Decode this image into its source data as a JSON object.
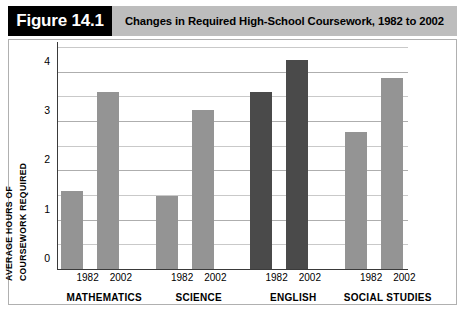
{
  "figure": {
    "badge": "Figure 14.1",
    "title": "Changes in Required High-School Coursework, 1982 to 2002"
  },
  "axis_caption": {
    "line1": "AVERAGE HOURS OF",
    "line2": "COURSEWORK REQUIRED"
  },
  "colors": {
    "bar_light": "#949494",
    "bar_dark": "#4a4a4a",
    "badge_bg": "#000000",
    "title_bg": "#bdbdbd",
    "gridline": "#c9c9c9",
    "axis": "#3a3a3a"
  },
  "chart_data": {
    "type": "bar",
    "title": "Changes in Required High-School Coursework, 1982 to 2002",
    "xlabel": "",
    "ylabel": "AVERAGE HOURS OF COURSEWORK REQUIRED",
    "ylim": [
      0,
      4.5
    ],
    "yticks": [
      0,
      1,
      2,
      3,
      4
    ],
    "ytick_labels": [
      "0",
      "1",
      "2",
      "3",
      "4"
    ],
    "gridlines": [
      0.5,
      1.0,
      1.5,
      2.0,
      2.5,
      3.0,
      3.5,
      4.0,
      4.5
    ],
    "grid": true,
    "legend": "none",
    "categories": [
      "MATHEMATICS",
      "SCIENCE",
      "ENGLISH",
      "SOCIAL STUDIES"
    ],
    "series": [
      {
        "name": "1982",
        "values": [
          1.6,
          1.5,
          3.6,
          2.8
        ]
      },
      {
        "name": "2002",
        "values": [
          3.6,
          3.25,
          4.25,
          3.9
        ]
      }
    ],
    "bar_colors": [
      "#949494",
      "#949494",
      "#4a4a4a",
      "#949494"
    ],
    "groups": [
      {
        "category": "MATHEMATICS",
        "color": "#949494",
        "bars": [
          {
            "year": "1982",
            "value": 1.6
          },
          {
            "year": "2002",
            "value": 3.6
          }
        ]
      },
      {
        "category": "SCIENCE",
        "color": "#949494",
        "bars": [
          {
            "year": "1982",
            "value": 1.5
          },
          {
            "year": "2002",
            "value": 3.25
          }
        ]
      },
      {
        "category": "ENGLISH",
        "color": "#4a4a4a",
        "bars": [
          {
            "year": "1982",
            "value": 3.6
          },
          {
            "year": "2002",
            "value": 4.25
          }
        ]
      },
      {
        "category": "SOCIAL STUDIES",
        "color": "#949494",
        "bars": [
          {
            "year": "1982",
            "value": 2.8
          },
          {
            "year": "2002",
            "value": 3.9
          }
        ]
      }
    ]
  }
}
